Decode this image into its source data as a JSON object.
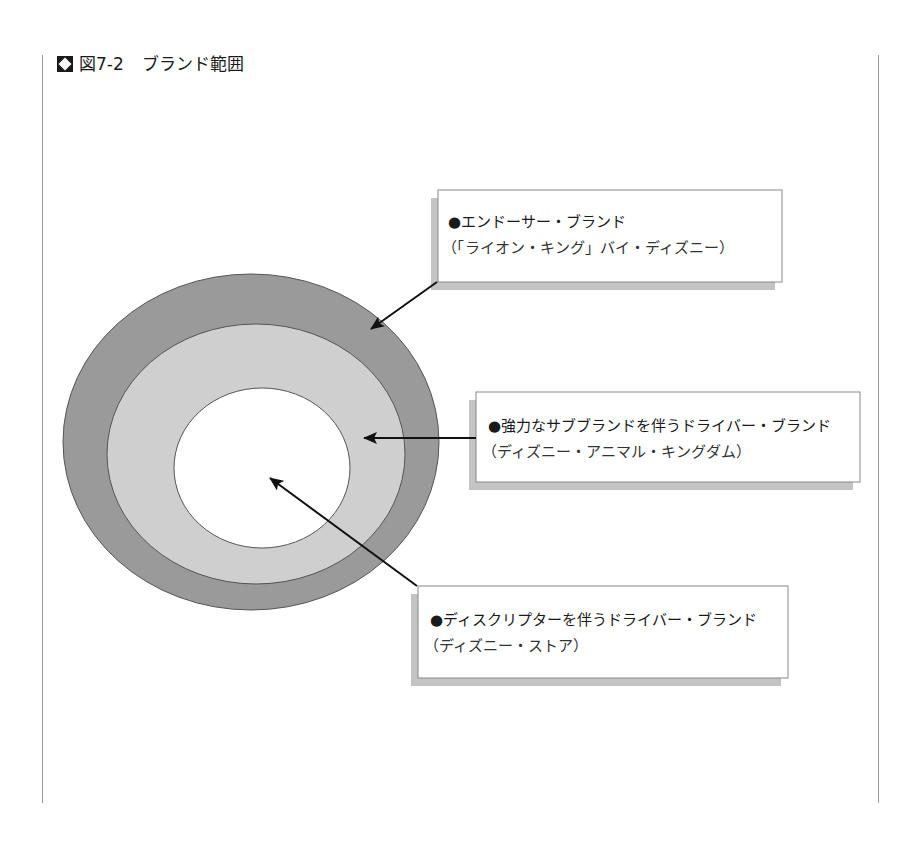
{
  "figure": {
    "icon": "diamond-square-icon",
    "number": "図7-2",
    "title": "ブランド範囲"
  },
  "diagram": {
    "type": "concentric-ellipses",
    "colors": {
      "outer_ring": "#9a9a9a",
      "middle_ring": "#cfcfcf",
      "inner_core": "#ffffff",
      "outline": "#555555",
      "arrow": "#111111",
      "shadow": "#c4c4c4"
    },
    "callouts": [
      {
        "bullet": "●",
        "label": "エンドーサー・ブランド",
        "example": "（「ライオン・キング」バイ・ディズニー）",
        "points_to": "outer_ring"
      },
      {
        "bullet": "●",
        "label": "強力なサブブランドを伴うドライバー・ブランド",
        "example": "（ディズニー・アニマル・キングダム）",
        "points_to": "middle_ring"
      },
      {
        "bullet": "●",
        "label": "ディスクリプターを伴うドライバー・ブランド",
        "example": "（ディズニー・ストア）",
        "points_to": "inner_core"
      }
    ]
  }
}
